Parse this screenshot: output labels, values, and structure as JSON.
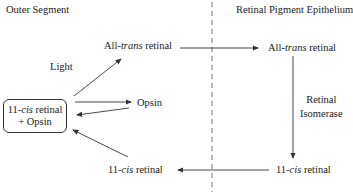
{
  "diagram": {
    "regions": {
      "left": "Outer Segment",
      "right": "Retinal Pigment Epithelium"
    },
    "nodes": {
      "os_all_trans": {
        "prefix": "All-",
        "italic": "trans",
        "suffix": " retinal"
      },
      "rpe_all_trans": {
        "prefix": "All-",
        "italic": "trans",
        "suffix": " retinal"
      },
      "complex": {
        "line1_prefix": "11-",
        "line1_italic": "cis",
        "line1_suffix": " retinal",
        "line2": "+ Opsin"
      },
      "opsin": "Opsin",
      "os_11_cis": {
        "prefix": "11-",
        "italic": "cis",
        "suffix": " retinal"
      },
      "rpe_11_cis": {
        "prefix": "11-",
        "italic": "cis",
        "suffix": " retinal"
      }
    },
    "edge_labels": {
      "light": "Light",
      "isomerase_line1": "Retinal",
      "isomerase_line2": "Isomerase"
    },
    "colors": {
      "line": "#333333",
      "text": "#222222"
    }
  }
}
